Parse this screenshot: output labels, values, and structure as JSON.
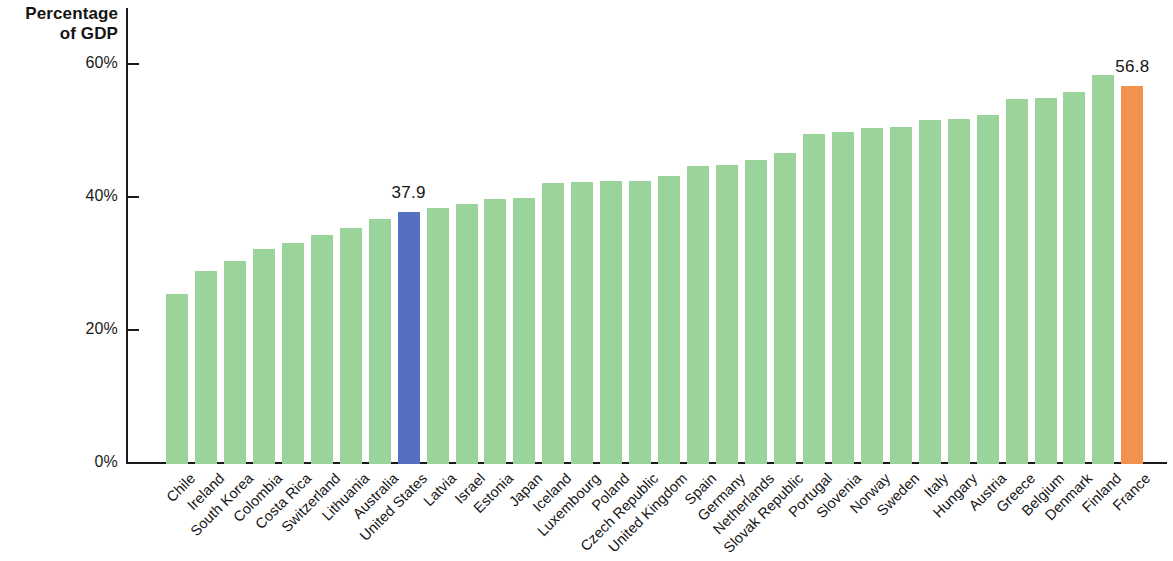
{
  "chart_data": {
    "type": "bar",
    "title": "",
    "ylabel": "Percentage\nof GDP",
    "xlabel": "",
    "ylim": [
      0,
      62
    ],
    "grid": false,
    "legend": "none",
    "ytick_labels": [
      "60%",
      "40%",
      "20%",
      "0%"
    ],
    "ytick_values": [
      60,
      40,
      20,
      0
    ],
    "categories": [
      "Chile",
      "Ireland",
      "South Korea",
      "Colombia",
      "Costa Rica",
      "Switzerland",
      "Lithuania",
      "Australia",
      "United States",
      "Latvia",
      "Israel",
      "Estonia",
      "Japan",
      "Iceland",
      "Luxembourg",
      "Poland",
      "Czech Republic",
      "United Kingdom",
      "Spain",
      "Germany",
      "Netherlands",
      "Slovak Republic",
      "Portugal",
      "Slovenia",
      "Norway",
      "Sweden",
      "Italy",
      "Hungary",
      "Austria",
      "Greece",
      "Belgium",
      "Denmark",
      "Finland",
      "France"
    ],
    "values": [
      25.6,
      29.0,
      30.6,
      32.4,
      33.3,
      34.5,
      35.5,
      36.8,
      37.9,
      38.5,
      39.1,
      39.8,
      40.0,
      42.3,
      42.4,
      42.5,
      42.6,
      43.3,
      44.8,
      45.0,
      45.7,
      46.8,
      49.6,
      50.0,
      50.5,
      50.7,
      51.7,
      51.9,
      52.5,
      54.9,
      55.1,
      55.9,
      58.5,
      56.8
    ],
    "highlights": [
      {
        "category": "United States",
        "value_label": "37.9",
        "color": "#5570c0"
      },
      {
        "category": "France",
        "value_label": "56.8",
        "color": "#f2924e"
      }
    ],
    "default_bar_color": "#9ad49a",
    "bar_colors": [
      "#9ad49a",
      "#9ad49a",
      "#9ad49a",
      "#9ad49a",
      "#9ad49a",
      "#9ad49a",
      "#9ad49a",
      "#9ad49a",
      "#5570c0",
      "#9ad49a",
      "#9ad49a",
      "#9ad49a",
      "#9ad49a",
      "#9ad49a",
      "#9ad49a",
      "#9ad49a",
      "#9ad49a",
      "#9ad49a",
      "#9ad49a",
      "#9ad49a",
      "#9ad49a",
      "#9ad49a",
      "#9ad49a",
      "#9ad49a",
      "#9ad49a",
      "#9ad49a",
      "#9ad49a",
      "#9ad49a",
      "#9ad49a",
      "#9ad49a",
      "#9ad49a",
      "#9ad49a",
      "#9ad49a",
      "#f2924e"
    ]
  }
}
